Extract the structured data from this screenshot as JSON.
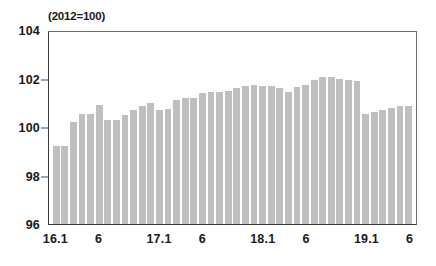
{
  "chart_data": {
    "type": "bar",
    "title": "",
    "subtitle": "",
    "unit_note": "(2012=100)",
    "xlabel": "",
    "ylabel": "",
    "ylim": [
      96,
      104
    ],
    "yticks": [
      96,
      98,
      100,
      102,
      104
    ],
    "grid": false,
    "legend": null,
    "bar_color": "#bfbfbf",
    "axis_color": "#3a3a3a",
    "categories": [
      "16.1",
      "16.2",
      "16.3",
      "16.4",
      "16.5",
      "16.6",
      "16.7",
      "16.8",
      "16.9",
      "16.10",
      "16.11",
      "16.12",
      "17.1",
      "17.2",
      "17.3",
      "17.4",
      "17.5",
      "17.6",
      "17.7",
      "17.8",
      "17.9",
      "17.10",
      "17.11",
      "17.12",
      "18.1",
      "18.2",
      "18.3",
      "18.4",
      "18.5",
      "18.6",
      "18.7",
      "18.8",
      "18.9",
      "18.10",
      "18.11",
      "18.12",
      "19.1",
      "19.2",
      "19.3",
      "19.4",
      "19.5",
      "19.6"
    ],
    "xtick_labels": [
      "16.1",
      "6",
      "17.1",
      "6",
      "18.1",
      "6",
      "19.1",
      "6"
    ],
    "xtick_categories": [
      "16.1",
      "16.6",
      "17.1",
      "17.6",
      "18.1",
      "18.6",
      "19.1",
      "19.6"
    ],
    "values": [
      99.2,
      99.2,
      100.2,
      100.55,
      100.55,
      100.9,
      100.3,
      100.3,
      100.5,
      100.7,
      100.85,
      101.0,
      100.7,
      100.75,
      101.1,
      101.2,
      101.2,
      101.4,
      101.45,
      101.45,
      101.5,
      101.6,
      101.7,
      101.75,
      101.7,
      101.7,
      101.6,
      101.45,
      101.65,
      101.75,
      101.95,
      102.05,
      102.05,
      102.0,
      101.95,
      101.9,
      100.55,
      100.6,
      100.7,
      100.8,
      100.85,
      100.85
    ]
  },
  "accessibility": {
    "figure_name": "indexed-bar-chart"
  }
}
